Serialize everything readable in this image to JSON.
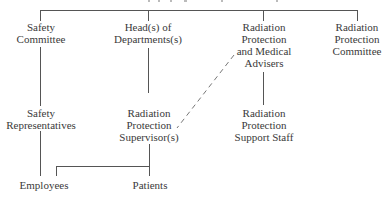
{
  "diagram": {
    "type": "organization-chart",
    "line_color": "#555555",
    "nodes": {
      "safety_committee": {
        "lines": [
          "Safety",
          "Committee"
        ]
      },
      "heads_of_departments": {
        "lines": [
          "Head(s) of",
          "Departments(s)"
        ]
      },
      "rp_medical_advisers": {
        "lines": [
          "Radiation",
          "Protection",
          "and Medical",
          "Advisers"
        ]
      },
      "rp_committee": {
        "lines": [
          "Radiation",
          "Protection",
          "Committee"
        ]
      },
      "safety_representatives": {
        "lines": [
          "Safety",
          "Representatives"
        ]
      },
      "rp_supervisors": {
        "lines": [
          "Radiation",
          "Protection",
          "Supervisor(s)"
        ]
      },
      "rp_support_staff": {
        "lines": [
          "Radiation",
          "Protection",
          "Support Staff"
        ]
      },
      "employees": {
        "lines": [
          "Employees"
        ]
      },
      "patients": {
        "lines": [
          "Patients"
        ]
      }
    },
    "edges": [
      {
        "from": "top",
        "to": "safety_committee",
        "style": "solid"
      },
      {
        "from": "top",
        "to": "heads_of_departments",
        "style": "solid"
      },
      {
        "from": "top",
        "to": "rp_medical_advisers",
        "style": "solid"
      },
      {
        "from": "top",
        "to": "rp_committee",
        "style": "solid"
      },
      {
        "from": "safety_committee",
        "to": "safety_representatives",
        "style": "solid"
      },
      {
        "from": "heads_of_departments",
        "to": "rp_supervisors",
        "style": "solid"
      },
      {
        "from": "rp_medical_advisers",
        "to": "rp_support_staff",
        "style": "solid"
      },
      {
        "from": "rp_medical_advisers",
        "to": "rp_supervisors",
        "style": "dashed"
      },
      {
        "from": "safety_representatives",
        "to": "employees",
        "style": "solid"
      },
      {
        "from": "rp_supervisors",
        "to": "employees",
        "style": "solid"
      },
      {
        "from": "rp_supervisors",
        "to": "patients",
        "style": "solid"
      }
    ]
  }
}
